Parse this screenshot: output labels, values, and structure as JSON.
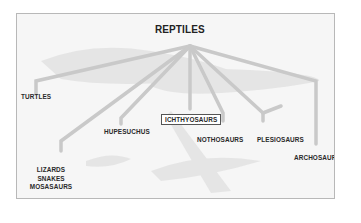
{
  "diagram": {
    "title": "REPTILES",
    "colors": {
      "branch": "#c9c9c9",
      "frame_border": "#b8b8b8",
      "text": "#2a2a2a",
      "background": "#f6f6f6"
    },
    "nodes": [
      {
        "id": "turtles",
        "label": "TURTLES"
      },
      {
        "id": "hupesuchus",
        "label": "HUPESUCHUS"
      },
      {
        "id": "ichthyosaurs",
        "label": "ICHTHYOSAURS",
        "highlighted": true
      },
      {
        "id": "nothosaurs",
        "label": "NOTHOSAURS"
      },
      {
        "id": "plesiosaurs",
        "label": "PLESIOSAURS"
      },
      {
        "id": "archosaurs",
        "label": "ARCHOSAURS"
      }
    ],
    "stacked_node": {
      "lines": [
        "LIZARDS",
        "SNAKES",
        "MOSASAURS"
      ]
    }
  }
}
